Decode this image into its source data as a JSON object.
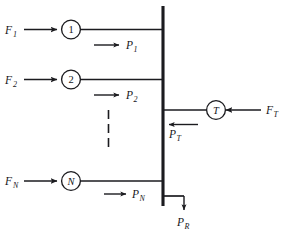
{
  "diagram": {
    "type": "one-line-diagram",
    "colors": {
      "line": "#1b1b1f",
      "background": "#ffffff",
      "text": "#16161a"
    },
    "units": [
      {
        "id": "unit-1",
        "node_label": "1",
        "node_label_style": "upright",
        "input_label": "F",
        "input_subscript": "1",
        "output_label": "P",
        "output_subscript": "1",
        "input_arrow_direction": "right",
        "output_arrow_direction": "right"
      },
      {
        "id": "unit-2",
        "node_label": "2",
        "node_label_style": "upright",
        "input_label": "F",
        "input_subscript": "2",
        "output_label": "P",
        "output_subscript": "2",
        "input_arrow_direction": "right",
        "output_arrow_direction": "right"
      },
      {
        "id": "unit-n",
        "node_label": "N",
        "node_label_style": "italic",
        "input_label": "F",
        "input_subscript": "N",
        "output_label": "P",
        "output_subscript": "N",
        "input_arrow_direction": "right",
        "output_arrow_direction": "right"
      }
    ],
    "continuation": {
      "name": "vertical-ellipsis",
      "style": "dashed"
    },
    "tie": {
      "id": "tie-t",
      "node_label": "T",
      "node_label_style": "italic",
      "input_label": "F",
      "input_subscript": "T",
      "output_label": "P",
      "output_subscript": "T",
      "input_arrow_direction": "left",
      "output_arrow_direction": "left"
    },
    "load": {
      "id": "load-r",
      "label": "P",
      "subscript": "R",
      "arrow_direction": "down"
    },
    "bus": {
      "name": "common-bus",
      "orientation": "vertical"
    }
  }
}
